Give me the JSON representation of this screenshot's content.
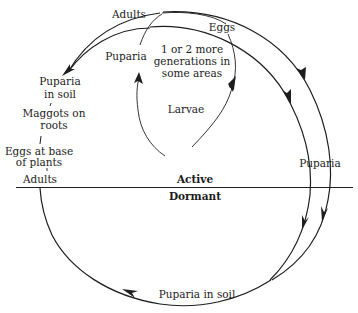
{
  "diagram": {
    "title": "",
    "divider": {
      "upper_label": "Active",
      "lower_label": "Dormant"
    },
    "inner_cycle": {
      "nodes": {
        "adults": "Adults",
        "eggs": "Eggs",
        "larvae": "Larvae",
        "puparia": "Puparia"
      },
      "center_note": [
        "1 or 2 more",
        "generations in",
        "some areas"
      ]
    },
    "left_stages": {
      "puparia_in_soil": [
        "Puparia",
        "in soil"
      ],
      "maggots_on_roots": [
        "Maggots on",
        "roots"
      ],
      "eggs_at_base": [
        "Eggs at base",
        "of plants"
      ],
      "adults": "Adults"
    },
    "right_stages": {
      "puparia": "Puparia"
    },
    "bottom_stage": {
      "puparia_in_soil": "Puparia in soil"
    },
    "colors": {
      "ink": "#1e1e1e",
      "background": "#ffffff"
    }
  }
}
